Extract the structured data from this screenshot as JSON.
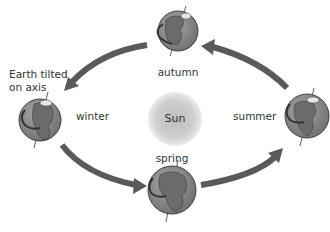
{
  "diagram": {
    "annotation": [
      "Earth tilted",
      "on axis"
    ],
    "sun": {
      "label": "Sun",
      "cx": 175,
      "cy": 119,
      "r": 27,
      "color": "#cfcfcf"
    },
    "arrow_color": "#5a5a5a",
    "globe_colors": {
      "ocean": "#8a8a8a",
      "land": "#6b6b6b",
      "ice": "#e6e6e6",
      "outline": "#333333"
    },
    "globes": [
      {
        "season": "autumn",
        "cx": 178,
        "cy": 31,
        "r": 20
      },
      {
        "season": "winter",
        "cx": 40,
        "cy": 120,
        "r": 21
      },
      {
        "season": "summer",
        "cx": 307,
        "cy": 116,
        "r": 22
      },
      {
        "season": "spring",
        "cx": 172,
        "cy": 190,
        "r": 24
      }
    ],
    "labels": {
      "autumn": "autumn",
      "winter": "winter",
      "summer": "summer",
      "spring": "spring"
    },
    "arrows": [
      {
        "from": "autumn",
        "to": "winter"
      },
      {
        "from": "winter",
        "to": "spring"
      },
      {
        "from": "spring",
        "to": "summer"
      },
      {
        "from": "summer",
        "to": "autumn"
      }
    ]
  }
}
